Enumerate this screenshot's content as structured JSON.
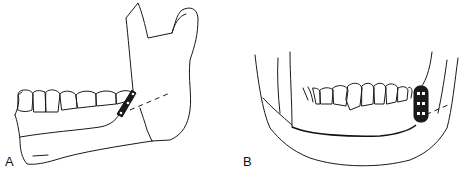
{
  "figure": {
    "panels": [
      {
        "label": "A",
        "description": "Lateral view of mandible with fracture line and miniplate fixation at angle"
      },
      {
        "label": "B",
        "description": "Frontal view of mandible with plate fixation and fracture line"
      }
    ]
  }
}
